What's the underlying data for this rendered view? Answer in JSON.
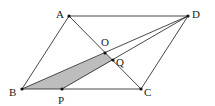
{
  "figure": {
    "type": "geometry",
    "colors": {
      "line": "#333333",
      "shade": "#bdbdbd",
      "point": "#111111",
      "background": "#ffffff"
    },
    "points": [
      {
        "id": "A",
        "label": "A",
        "x": 69,
        "y": 16,
        "lx": 56,
        "ly": 18
      },
      {
        "id": "D",
        "label": "D",
        "x": 188,
        "y": 16,
        "lx": 192,
        "ly": 18
      },
      {
        "id": "B",
        "label": "B",
        "x": 22,
        "y": 89,
        "lx": 9,
        "ly": 96
      },
      {
        "id": "C",
        "label": "C",
        "x": 141,
        "y": 89,
        "lx": 144,
        "ly": 96
      },
      {
        "id": "P",
        "label": "P",
        "x": 62,
        "y": 89,
        "lx": 58,
        "ly": 104
      },
      {
        "id": "O",
        "label": "O",
        "x": 105,
        "y": 53,
        "lx": 101,
        "ly": 46
      },
      {
        "id": "Q",
        "label": "Q",
        "x": 113,
        "y": 60,
        "lx": 116,
        "ly": 66
      }
    ],
    "segments": [
      [
        "A",
        "D"
      ],
      [
        "D",
        "C"
      ],
      [
        "C",
        "B"
      ],
      [
        "B",
        "A"
      ],
      [
        "A",
        "C"
      ],
      [
        "B",
        "D"
      ],
      [
        "D",
        "P"
      ]
    ],
    "shaded_polygon": [
      "B",
      "P",
      "Q",
      "O"
    ]
  }
}
